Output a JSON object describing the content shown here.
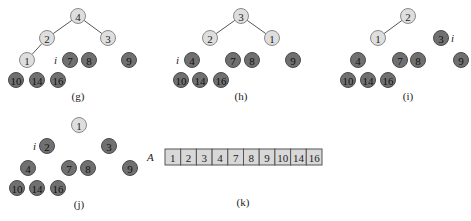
{
  "panels": [
    {
      "caption": "(g)",
      "caption_pos": [
        78,
        100
      ],
      "index_label": {
        "text": "i",
        "x": 54,
        "y": 64
      },
      "nodes": [
        {
          "v": "4",
          "x": 78,
          "y": 16,
          "shade": "light"
        },
        {
          "v": "2",
          "x": 47,
          "y": 38,
          "shade": "light"
        },
        {
          "v": "3",
          "x": 108,
          "y": 38,
          "shade": "light"
        },
        {
          "v": "1",
          "x": 27,
          "y": 60,
          "shade": "light"
        },
        {
          "v": "7",
          "x": 70,
          "y": 60,
          "shade": "dark"
        },
        {
          "v": "8",
          "x": 89,
          "y": 60,
          "shade": "dark"
        },
        {
          "v": "9",
          "x": 129,
          "y": 60,
          "shade": "dark"
        },
        {
          "v": "10",
          "x": 16,
          "y": 80,
          "shade": "dark"
        },
        {
          "v": "14",
          "x": 37,
          "y": 80,
          "shade": "dark"
        },
        {
          "v": "16",
          "x": 58,
          "y": 80,
          "shade": "dark"
        }
      ],
      "edges": [
        [
          0,
          1
        ],
        [
          0,
          2
        ],
        [
          1,
          3
        ]
      ]
    },
    {
      "caption": "(h)",
      "caption_pos": [
        241,
        100
      ],
      "index_label": {
        "text": "i",
        "x": 176,
        "y": 64
      },
      "nodes": [
        {
          "v": "3",
          "x": 241,
          "y": 16,
          "shade": "light"
        },
        {
          "v": "2",
          "x": 210,
          "y": 38,
          "shade": "light"
        },
        {
          "v": "1",
          "x": 272,
          "y": 38,
          "shade": "light"
        },
        {
          "v": "4",
          "x": 192,
          "y": 60,
          "shade": "dark"
        },
        {
          "v": "7",
          "x": 233,
          "y": 60,
          "shade": "dark"
        },
        {
          "v": "8",
          "x": 252,
          "y": 60,
          "shade": "dark"
        },
        {
          "v": "9",
          "x": 293,
          "y": 60,
          "shade": "dark"
        },
        {
          "v": "10",
          "x": 181,
          "y": 80,
          "shade": "dark"
        },
        {
          "v": "14",
          "x": 200,
          "y": 80,
          "shade": "dark"
        },
        {
          "v": "16",
          "x": 221,
          "y": 80,
          "shade": "dark"
        }
      ],
      "edges": [
        [
          0,
          1
        ],
        [
          0,
          2
        ]
      ]
    },
    {
      "caption": "(i)",
      "caption_pos": [
        408,
        100
      ],
      "index_label": {
        "text": "i",
        "x": 451,
        "y": 42
      },
      "nodes": [
        {
          "v": "2",
          "x": 408,
          "y": 16,
          "shade": "light"
        },
        {
          "v": "1",
          "x": 378,
          "y": 38,
          "shade": "light"
        },
        {
          "v": "3",
          "x": 441,
          "y": 38,
          "shade": "dark"
        },
        {
          "v": "4",
          "x": 358,
          "y": 60,
          "shade": "dark"
        },
        {
          "v": "7",
          "x": 400,
          "y": 60,
          "shade": "dark"
        },
        {
          "v": "8",
          "x": 418,
          "y": 60,
          "shade": "dark"
        },
        {
          "v": "9",
          "x": 461,
          "y": 60,
          "shade": "dark"
        },
        {
          "v": "10",
          "x": 348,
          "y": 80,
          "shade": "dark"
        },
        {
          "v": "14",
          "x": 368,
          "y": 80,
          "shade": "dark"
        },
        {
          "v": "16",
          "x": 388,
          "y": 80,
          "shade": "dark"
        }
      ],
      "edges": [
        [
          0,
          1
        ]
      ]
    },
    {
      "caption": "(j)",
      "caption_pos": [
        79,
        208
      ],
      "index_label": {
        "text": "i",
        "x": 33,
        "y": 150
      },
      "nodes": [
        {
          "v": "1",
          "x": 79,
          "y": 125,
          "shade": "light"
        },
        {
          "v": "2",
          "x": 47,
          "y": 146,
          "shade": "dark"
        },
        {
          "v": "3",
          "x": 109,
          "y": 146,
          "shade": "dark"
        },
        {
          "v": "4",
          "x": 28,
          "y": 168,
          "shade": "dark"
        },
        {
          "v": "7",
          "x": 69,
          "y": 168,
          "shade": "dark"
        },
        {
          "v": "8",
          "x": 88,
          "y": 168,
          "shade": "dark"
        },
        {
          "v": "9",
          "x": 130,
          "y": 168,
          "shade": "dark"
        },
        {
          "v": "10",
          "x": 17,
          "y": 188,
          "shade": "dark"
        },
        {
          "v": "14",
          "x": 37,
          "y": 188,
          "shade": "dark"
        },
        {
          "v": "16",
          "x": 58,
          "y": 188,
          "shade": "dark"
        }
      ],
      "edges": []
    }
  ],
  "array_panel": {
    "caption": "(k)",
    "caption_pos": [
      243,
      206
    ],
    "name": "A",
    "name_pos": [
      147,
      161
    ],
    "origin": [
      165,
      149
    ],
    "cell_w": 15.7,
    "cell_h": 16,
    "values": [
      "1",
      "2",
      "3",
      "4",
      "7",
      "8",
      "9",
      "10",
      "14",
      "16"
    ]
  },
  "colors": {
    "light_node": "#dedede",
    "dark_node": "#707070",
    "array_cell": "#d8d8d8"
  }
}
